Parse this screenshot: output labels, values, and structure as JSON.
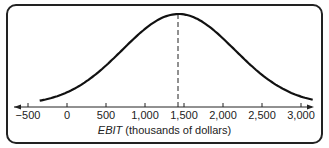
{
  "chart_data": {
    "type": "line",
    "title": "",
    "xlabel": "EBIT (thousands of dollars)",
    "xlabel_italic": "EBIT",
    "xlabel_rest": "(thousands of dollars)",
    "ylabel": "",
    "tick_labels": [
      "−500",
      "0",
      "500",
      "1,000",
      "1,500",
      "2,000",
      "2,500",
      "3,000"
    ],
    "ticks": [
      -500,
      0,
      500,
      1000,
      1500,
      2000,
      2500,
      3000
    ],
    "xlim": [
      -800,
      3300
    ],
    "series": [
      {
        "name": "Probability distribution of EBIT",
        "shape": "normal",
        "mean": 1430,
        "x_range": [
          -350,
          3150
        ]
      }
    ],
    "annotations": [
      {
        "type": "dashed-vertical-line",
        "x": 1430,
        "label": "expected EBIT"
      }
    ],
    "grid": false,
    "legend": "none"
  }
}
